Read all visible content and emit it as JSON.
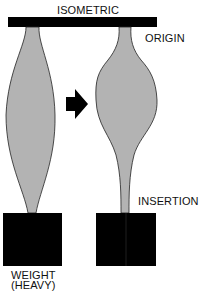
{
  "labels": {
    "isometric": "ISOMETRIC",
    "origin": "ORIGIN",
    "insertion": "INSERTION",
    "weight_line1": "WEIGHT",
    "weight_line2": "(HEAVY)"
  },
  "colors": {
    "muscle_fill": "#b3b3b3",
    "outline": "#222222",
    "block": "#000000",
    "bar": "#000000"
  }
}
